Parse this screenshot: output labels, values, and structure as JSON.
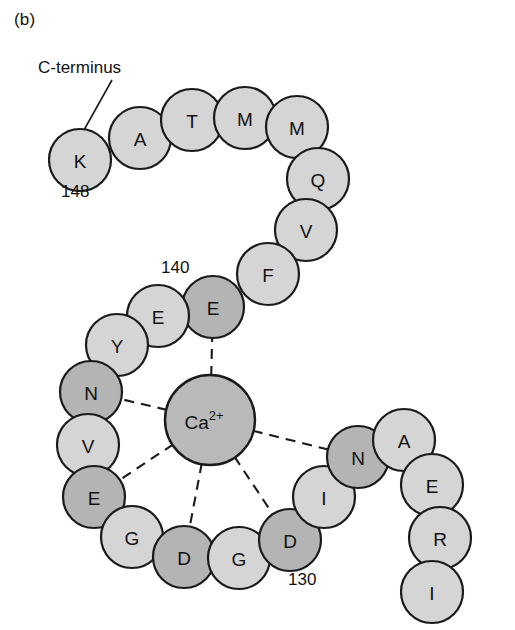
{
  "figure": {
    "panel_label": "(b)",
    "terminus_annotation": "C-terminus",
    "ion": {
      "name": "Ca2+",
      "base_text": "Ca",
      "superscript": "2+",
      "cx": 210,
      "cy": 420,
      "r": 45,
      "fill": "#b9b9b9",
      "stroke": "#1a1a1a"
    },
    "colors": {
      "residue_light": "#d5d5d5",
      "residue_dark": "#b4b4b4",
      "outline": "#1a1a1a",
      "background": "#ffffff",
      "text": "#111111"
    },
    "position_numbers": [
      {
        "name": "residue-number-148",
        "text": "148",
        "x": 61,
        "y": 182
      },
      {
        "name": "residue-number-140",
        "text": "140",
        "x": 161,
        "y": 258
      },
      {
        "name": "residue-number-130",
        "text": "130",
        "x": 288,
        "y": 570
      }
    ],
    "residues": [
      {
        "id": "K148",
        "letter": "K",
        "cx": 80,
        "cy": 160,
        "r": 31,
        "shade": "light"
      },
      {
        "id": "A147",
        "letter": "A",
        "cx": 140,
        "cy": 138,
        "r": 31,
        "shade": "light"
      },
      {
        "id": "T146",
        "letter": "T",
        "cx": 192,
        "cy": 120,
        "r": 31,
        "shade": "light"
      },
      {
        "id": "M145",
        "letter": "M",
        "cx": 245,
        "cy": 118,
        "r": 31,
        "shade": "light"
      },
      {
        "id": "M144",
        "letter": "M",
        "cx": 297,
        "cy": 127,
        "r": 31,
        "shade": "light"
      },
      {
        "id": "Q143",
        "letter": "Q",
        "cx": 318,
        "cy": 179,
        "r": 31,
        "shade": "light"
      },
      {
        "id": "V142",
        "letter": "V",
        "cx": 306,
        "cy": 230,
        "r": 31,
        "shade": "light"
      },
      {
        "id": "F141",
        "letter": "F",
        "cx": 268,
        "cy": 274,
        "r": 31,
        "shade": "light"
      },
      {
        "id": "E140",
        "letter": "E",
        "cx": 213,
        "cy": 307,
        "r": 31,
        "shade": "dark"
      },
      {
        "id": "E139",
        "letter": "E",
        "cx": 158,
        "cy": 316,
        "r": 31,
        "shade": "light"
      },
      {
        "id": "Y138",
        "letter": "Y",
        "cx": 117,
        "cy": 345,
        "r": 31,
        "shade": "light"
      },
      {
        "id": "N137",
        "letter": "N",
        "cx": 91,
        "cy": 392,
        "r": 31,
        "shade": "dark"
      },
      {
        "id": "V136",
        "letter": "V",
        "cx": 88,
        "cy": 445,
        "r": 31,
        "shade": "light"
      },
      {
        "id": "E135",
        "letter": "E",
        "cx": 94,
        "cy": 497,
        "r": 31,
        "shade": "dark"
      },
      {
        "id": "G134",
        "letter": "G",
        "cx": 132,
        "cy": 537,
        "r": 31,
        "shade": "light"
      },
      {
        "id": "D133",
        "letter": "D",
        "cx": 184,
        "cy": 557,
        "r": 31,
        "shade": "dark"
      },
      {
        "id": "G132",
        "letter": "G",
        "cx": 239,
        "cy": 558,
        "r": 31,
        "shade": "light"
      },
      {
        "id": "D131",
        "letter": "D",
        "cx": 290,
        "cy": 540,
        "r": 31,
        "shade": "dark"
      },
      {
        "id": "I130",
        "letter": "I",
        "cx": 324,
        "cy": 497,
        "r": 31,
        "shade": "light"
      },
      {
        "id": "N129",
        "letter": "N",
        "cx": 358,
        "cy": 457,
        "r": 31,
        "shade": "dark"
      },
      {
        "id": "A128",
        "letter": "A",
        "cx": 404,
        "cy": 440,
        "r": 31,
        "shade": "light"
      },
      {
        "id": "E127",
        "letter": "E",
        "cx": 432,
        "cy": 485,
        "r": 31,
        "shade": "light"
      },
      {
        "id": "R126",
        "letter": "R",
        "cx": 440,
        "cy": 538,
        "r": 31,
        "shade": "light"
      },
      {
        "id": "I125",
        "letter": "I",
        "cx": 432,
        "cy": 592,
        "r": 31,
        "shade": "light"
      }
    ],
    "coordination_bonds": [
      {
        "name": "bond-ca-to-E140",
        "from": "Ca2+",
        "to": "E140"
      },
      {
        "name": "bond-ca-to-N137",
        "from": "Ca2+",
        "to": "N137"
      },
      {
        "name": "bond-ca-to-E135",
        "from": "Ca2+",
        "to": "E135"
      },
      {
        "name": "bond-ca-to-D133",
        "from": "Ca2+",
        "to": "D133"
      },
      {
        "name": "bond-ca-to-D131",
        "from": "Ca2+",
        "to": "D131"
      },
      {
        "name": "bond-ca-to-N129",
        "from": "Ca2+",
        "to": "N129"
      }
    ],
    "leader_line": {
      "name": "c-terminus-leader-line",
      "x1": 112,
      "y1": 80,
      "x2": 84,
      "y2": 130
    }
  }
}
